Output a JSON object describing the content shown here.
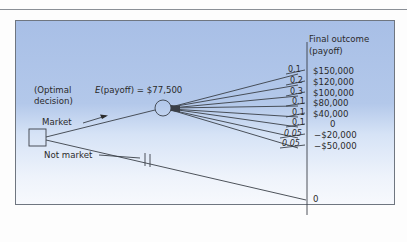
{
  "diagram": {
    "type": "decision-tree",
    "header_title": "Final outcome",
    "header_subtitle": "(payoff)",
    "decision_label_line1": "(Optimal",
    "decision_label_line2": "decision)",
    "expected_label_prefix": "E",
    "expected_label_rest": "(payoff) = $77,500",
    "expected_payoff": "$77,500",
    "branches": {
      "market": {
        "label": "Market",
        "optimal": true
      },
      "not_market": {
        "label": "Not market",
        "pruned": true,
        "payoff": "0"
      }
    },
    "outcomes": [
      {
        "prob": "0.1",
        "payoff": "$150,000"
      },
      {
        "prob": "0.2",
        "payoff": "$120,000"
      },
      {
        "prob": "0.3",
        "payoff": "$100,000"
      },
      {
        "prob": "0.1",
        "payoff": "$80,000"
      },
      {
        "prob": "0.1",
        "payoff": "$40,000"
      },
      {
        "prob": "0.1",
        "payoff": "0"
      },
      {
        "prob": "0.05",
        "payoff": "−$20,000"
      },
      {
        "prob": "0.05",
        "payoff": "−$50,000"
      }
    ],
    "colors": {
      "panel_top": "#a8bfe6",
      "panel_bottom": "#f7f9fd",
      "line": "#3a3f47",
      "text": "#2a2a2a"
    }
  }
}
